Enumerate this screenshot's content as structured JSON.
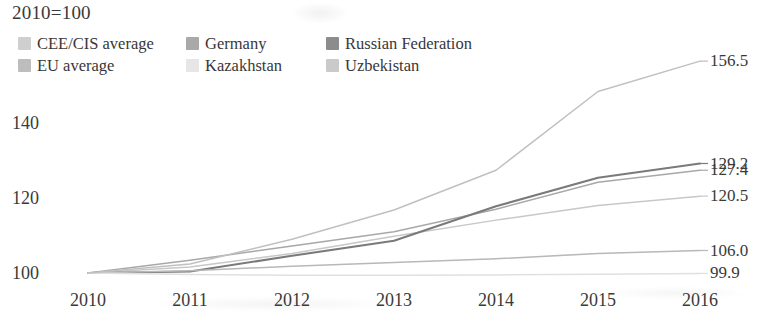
{
  "chart_data": {
    "type": "line",
    "title": "2010=100",
    "xlabel": "",
    "ylabel": "",
    "x": [
      2010,
      2011,
      2012,
      2013,
      2014,
      2015,
      2016
    ],
    "xtick_labels": [
      "2010",
      "2011",
      "2012",
      "2013",
      "2014",
      "2015",
      "2016"
    ],
    "ytick_labels": [
      "100",
      "120",
      "140"
    ],
    "ytick_values": [
      100,
      120,
      140
    ],
    "ylim": [
      98,
      160
    ],
    "xlim": [
      2010,
      2016
    ],
    "grid": false,
    "axis_lines": false,
    "legend_position": "top-left",
    "series": [
      {
        "name": "CEE/CIS average",
        "color": "#c8c8c8",
        "values": [
          100.0,
          101.6,
          105.2,
          109.8,
          114.1,
          118.0,
          120.5
        ],
        "end_label": "120.5"
      },
      {
        "name": "Germany",
        "color": "#a8a8a8",
        "values": [
          100.0,
          103.4,
          107.2,
          111.0,
          117.0,
          124.2,
          127.4
        ],
        "end_label": "127.4"
      },
      {
        "name": "Russian Federation",
        "color": "#7a7a7a",
        "values": [
          100.0,
          100.4,
          104.6,
          108.6,
          117.8,
          125.4,
          129.2
        ],
        "end_label": "129.2"
      },
      {
        "name": "EU average",
        "color": "#b8b8b8",
        "values": [
          100.0,
          100.6,
          101.8,
          102.8,
          103.8,
          105.2,
          106.0
        ],
        "end_label": "106.0"
      },
      {
        "name": "Kazakhstan",
        "color": "#e0e0e0",
        "values": [
          100.0,
          99.6,
          99.4,
          99.4,
          99.5,
          99.7,
          99.9
        ],
        "end_label": "99.9"
      },
      {
        "name": "Uzbekistan",
        "color": "#c0c0c0",
        "values": [
          100.0,
          102.4,
          109.0,
          116.8,
          127.4,
          148.4,
          156.5
        ],
        "end_label": "156.5"
      }
    ],
    "end_labels": [
      "156.5",
      "129.2",
      "127.4",
      "120.5",
      "106.0",
      "99.9"
    ]
  },
  "legend": {
    "row1": [
      {
        "label": "CEE/CIS average",
        "color": "#cfcfcf"
      },
      {
        "label": "Germany",
        "color": "#a9a9a9"
      },
      {
        "label": "Russian Federation",
        "color": "#8c8c8c"
      }
    ],
    "row2": [
      {
        "label": "EU average",
        "color": "#bdbdbd"
      },
      {
        "label": "Kazakhstan",
        "color": "#e6e6e6"
      },
      {
        "label": "Uzbekistan",
        "color": "#cacaca"
      }
    ]
  }
}
